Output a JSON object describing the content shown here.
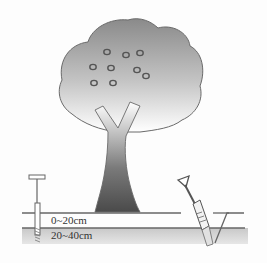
{
  "diagram": {
    "elements": [
      "tree-canopy",
      "tree-trunk",
      "soil-auger",
      "soil-shovel",
      "sampling-pit",
      "soil-layers"
    ],
    "layers": [
      {
        "label": "0~20cm"
      },
      {
        "label": "20~40cm"
      }
    ],
    "colors": {
      "canopy_top": "#8a8a8a",
      "canopy_bottom": "#ffffff",
      "trunk_dark": "#555555",
      "ground_line": "#6a6a6a",
      "lower_layer": "#d2d2d2"
    }
  }
}
